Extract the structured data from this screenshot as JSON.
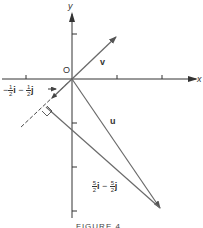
{
  "figure": {
    "axes": {
      "x_label": "x",
      "y_label": "y",
      "origin_label": "O"
    },
    "vectors": {
      "v": {
        "label": "v"
      },
      "u": {
        "label": "u"
      },
      "projection": {
        "label_parts": [
          "−",
          "1",
          "2",
          "i",
          "−",
          "1",
          "2",
          "j"
        ],
        "text": "−½i − ½j"
      },
      "difference": {
        "label_parts": [
          "5",
          "2",
          "i",
          "−",
          "5",
          "2",
          "j"
        ],
        "text": "5/2 i − 5/2 j"
      }
    },
    "caption": "FIGURE 4"
  },
  "colors": {
    "arrow": "#6a6a6a",
    "axis": "#333333"
  }
}
